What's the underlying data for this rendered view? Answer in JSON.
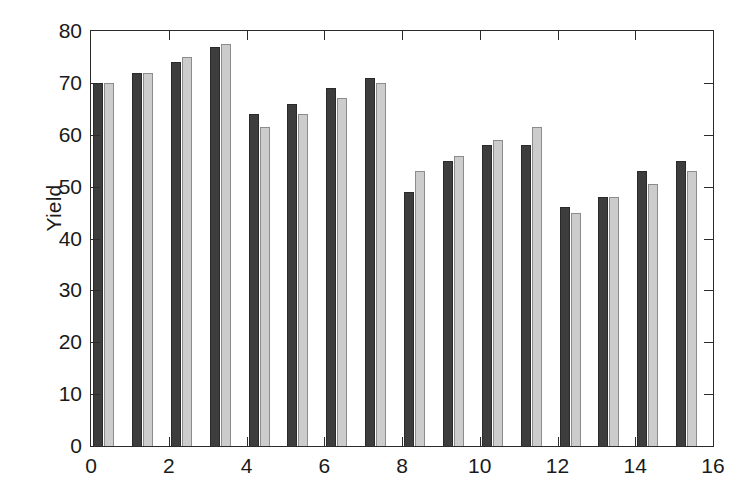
{
  "chart_data": {
    "type": "bar",
    "title": "",
    "subtitle": "",
    "xlabel": "",
    "ylabel": "Yield",
    "xlim": [
      0,
      16
    ],
    "ylim": [
      0,
      80
    ],
    "ytick_values": [
      0,
      10,
      20,
      30,
      40,
      50,
      60,
      70,
      80
    ],
    "ytick_labels": [
      "0",
      "10",
      "20",
      "30",
      "40",
      "50",
      "60",
      "70",
      "80"
    ],
    "xtick_values": [
      0,
      2,
      4,
      6,
      8,
      10,
      12,
      14,
      16
    ],
    "xtick_labels": [
      "0",
      "2",
      "4",
      "6",
      "8",
      "10",
      "12",
      "14",
      "16"
    ],
    "grid": false,
    "legend": false,
    "legend_position": "none",
    "categories": [
      0,
      1,
      2,
      3,
      4,
      5,
      6,
      7,
      8,
      9,
      10,
      11,
      12,
      13,
      14,
      15
    ],
    "series": [
      {
        "name": "Series 1",
        "color": "#3d3d3d",
        "values": [
          70,
          72,
          74,
          77,
          64,
          66,
          69,
          71,
          49,
          55,
          58,
          58,
          46,
          48,
          53,
          55
        ]
      },
      {
        "name": "Series 2",
        "color": "#cccccc",
        "values": [
          70,
          72,
          75,
          77.5,
          61.5,
          64,
          67,
          70,
          53,
          56,
          59,
          61.5,
          45,
          48,
          50.5,
          53
        ]
      }
    ],
    "colors": {
      "series1": "#3d3d3d",
      "series2": "#cccccc",
      "axis": "#2b2b2b",
      "background": "#ffffff",
      "text": "#1a1a1a"
    }
  }
}
